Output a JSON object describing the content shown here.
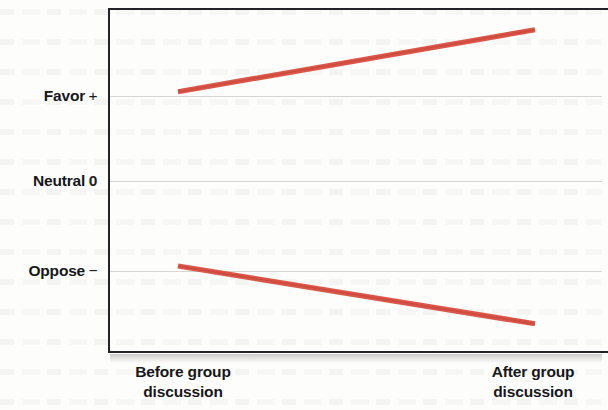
{
  "chart_data": {
    "type": "line",
    "title": "",
    "subtitle": "",
    "xlabel": "",
    "ylabel": "",
    "grid": true,
    "legend": false,
    "x": [
      "Before group discussion",
      "After group discussion"
    ],
    "categories": [
      "Before group discussion",
      "After group discussion"
    ],
    "y_axis": {
      "ticks": [
        {
          "label": "Favor",
          "symbol": "+",
          "value": 1
        },
        {
          "label": "Neutral",
          "symbol": "0",
          "value": 0
        },
        {
          "label": "Oppose",
          "symbol": "−",
          "value": -1
        }
      ],
      "ylim": [
        -2,
        2
      ]
    },
    "series": [
      {
        "name": "Initially favoring group",
        "color": "#d9574a",
        "values": [
          1.05,
          1.78
        ]
      },
      {
        "name": "Initially opposing group",
        "color": "#d9574a",
        "values": [
          -1.0,
          -1.68
        ]
      }
    ],
    "annotations": []
  },
  "axes": {
    "y_ticks": [
      {
        "name": "Favor",
        "symbol": "+"
      },
      {
        "name": "Neutral",
        "symbol": "0"
      },
      {
        "name": "Oppose",
        "symbol": "−"
      }
    ],
    "x_ticks": [
      {
        "label": "Before group\ndiscussion"
      },
      {
        "label": "After group\ndiscussion"
      }
    ]
  },
  "style": {
    "line_color": "#d9574a",
    "line_color_dark": "#c0392b",
    "axis_color": "#232327",
    "grid_color": "#d8d6d3",
    "text_color": "#17171a",
    "background": "#fdfdfc"
  }
}
